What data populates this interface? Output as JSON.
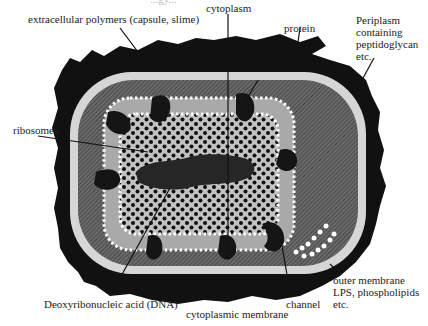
{
  "figure": {
    "title_cutoff": "...gy...",
    "labels": {
      "extracellular": "extracellular polymers (capsule, slime)",
      "cytoplasm": "cytoplasm",
      "protein": "protein",
      "periplasm_1": "Periplasm",
      "periplasm_2": "containing",
      "periplasm_3": "peptidoglycan",
      "periplasm_4": "etc.",
      "ribosomes": "ribosomes",
      "dna": "Deoxyribonucleic acid (DNA)",
      "cytoplasmic_membrane": "cytoplasmic membrane",
      "channel": "channel",
      "outer_1": "outer membrane",
      "outer_2": "LPS, phospholipids",
      "outer_3": "etc."
    },
    "colors": {
      "capsule": "#111111",
      "outer_membrane": "#d8d8d8",
      "periplasm": "#555555",
      "lipid_bilayer": "#b8b8b8",
      "cytoplasm": "#c4c4c4",
      "ribosome": "#111111",
      "head_groups": "#ffffff",
      "dna": "#2a2a2a"
    }
  }
}
